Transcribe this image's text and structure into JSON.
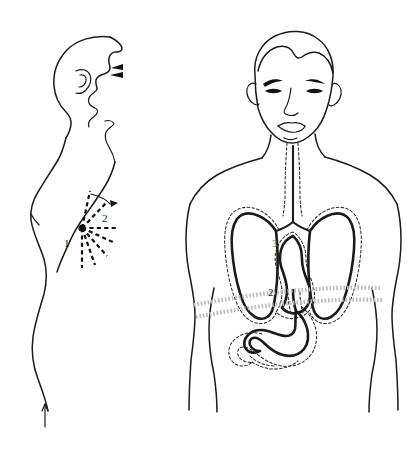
{
  "figure": {
    "background_color": "#ffffff",
    "line_color": "#1a1a1a",
    "organ_line_color": "#111111",
    "halo_color": "#2b2b2b",
    "diaphragm_color": "#b9b9b9",
    "width": 410,
    "height": 453
  },
  "panels": {
    "left": {
      "name": "lateral-profile-figure",
      "description": "Side view of head, neck and trunk with radiating referred-pain lines",
      "pain_point": {
        "label": "pain-origin-dot",
        "x": 82,
        "y": 228,
        "radius": 3.6
      },
      "ray_count": 7,
      "labels": [
        {
          "text": "1",
          "x": 68,
          "y": 243
        },
        {
          "text": "2",
          "x": 106,
          "y": 218
        }
      ]
    },
    "right": {
      "name": "anterior-torso-figure",
      "description": "Front view of head and torso showing trachea, lungs, heart, esophagus, stomach and diaphragm",
      "labels": [
        {
          "text": "2",
          "x": 271,
          "y": 296
        },
        {
          "text": "1",
          "x": 296,
          "y": 317
        },
        {
          "text": "3",
          "x": 276,
          "y": 243
        }
      ],
      "organs": [
        "trachea",
        "right-lung",
        "left-lung",
        "heart",
        "esophagus",
        "stomach",
        "diaphragm"
      ]
    }
  }
}
